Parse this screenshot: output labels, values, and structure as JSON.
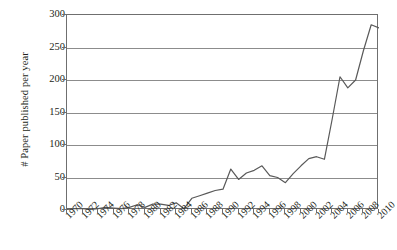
{
  "chart_data": {
    "type": "line",
    "title": "",
    "xlabel": "",
    "ylabel": "# Paper published per year",
    "xlim": [
      1970,
      2010
    ],
    "ylim": [
      0,
      300
    ],
    "ytick_labels": [
      "300",
      "250",
      "200",
      "150",
      "100",
      "50",
      "0"
    ],
    "ytick_values": [
      300,
      250,
      200,
      150,
      100,
      50,
      0
    ],
    "xtick_labels": [
      "1970",
      "1972",
      "1974",
      "1976",
      "1978",
      "1980",
      "1982",
      "1984",
      "1986",
      "1988",
      "1990",
      "1992",
      "1994",
      "1996",
      "1998",
      "2000",
      "2002",
      "2004",
      "2006",
      "2008",
      "2010"
    ],
    "xtick_values": [
      1970,
      1972,
      1974,
      1976,
      1978,
      1980,
      1982,
      1984,
      1986,
      1988,
      1990,
      1992,
      1994,
      1996,
      1998,
      2000,
      2002,
      2004,
      2006,
      2008,
      2010
    ],
    "grid": "horizontal",
    "legend": "none",
    "series": [
      {
        "name": "Papers published per year",
        "color": "#595959",
        "x": [
          1970,
          1971,
          1972,
          1973,
          1974,
          1975,
          1976,
          1977,
          1978,
          1979,
          1980,
          1981,
          1982,
          1983,
          1984,
          1985,
          1986,
          1987,
          1988,
          1989,
          1990,
          1991,
          1992,
          1993,
          1994,
          1995,
          1996,
          1997,
          1998,
          1999,
          2000,
          2001,
          2002,
          2003,
          2004,
          2005,
          2006,
          2007,
          2008,
          2009,
          2010
        ],
        "values": [
          1,
          2,
          2,
          1,
          2,
          4,
          3,
          2,
          4,
          8,
          4,
          9,
          9,
          7,
          11,
          2,
          18,
          22,
          26,
          30,
          32,
          63,
          47,
          57,
          61,
          68,
          53,
          50,
          42,
          56,
          68,
          79,
          82,
          78,
          140,
          205,
          188,
          200,
          245,
          285,
          280
        ]
      }
    ]
  }
}
